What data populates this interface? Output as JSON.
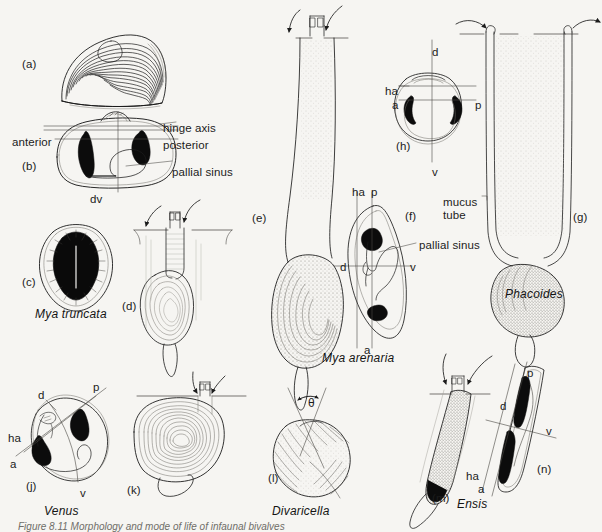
{
  "figure": {
    "background_color": "#f6f5f2",
    "ink_color": "#1c1c1c",
    "caption": "Figure 8.11   Morphology and mode of life of infaunal bivalves"
  },
  "panels": [
    {
      "id": "a",
      "label": "(a)",
      "x": 22,
      "y": 58
    },
    {
      "id": "b",
      "label": "(b)",
      "x": 22,
      "y": 160
    },
    {
      "id": "c",
      "label": "(c)",
      "x": 22,
      "y": 276
    },
    {
      "id": "d",
      "label": "(d)",
      "x": 122,
      "y": 300
    },
    {
      "id": "e",
      "label": "(e)",
      "x": 252,
      "y": 212
    },
    {
      "id": "f",
      "label": "(f)",
      "x": 405,
      "y": 210
    },
    {
      "id": "g",
      "label": "(g)",
      "x": 573,
      "y": 211
    },
    {
      "id": "h",
      "label": "(h)",
      "x": 396,
      "y": 140
    },
    {
      "id": "j",
      "label": "(j)",
      "x": 26,
      "y": 480
    },
    {
      "id": "k",
      "label": "(k)",
      "x": 127,
      "y": 484
    },
    {
      "id": "l",
      "label": "(l)",
      "x": 268,
      "y": 472
    },
    {
      "id": "m",
      "label": "(m)",
      "x": 432,
      "y": 492
    },
    {
      "id": "n",
      "label": "(n)",
      "x": 537,
      "y": 463
    }
  ],
  "species_labels": [
    {
      "name": "Mya truncata",
      "x": 35,
      "y": 308
    },
    {
      "name": "Mya arenaria",
      "x": 322,
      "y": 352
    },
    {
      "name": "Phacoides",
      "x": 505,
      "y": 288
    },
    {
      "name": "Venus",
      "x": 44,
      "y": 505
    },
    {
      "name": "Divaricella",
      "x": 272,
      "y": 505
    },
    {
      "name": "Ensis",
      "x": 457,
      "y": 498
    }
  ],
  "annotations": {
    "panel_b": [
      {
        "text": "hinge axis",
        "x": 163,
        "y": 122
      },
      {
        "text": "anterior",
        "x": 12,
        "y": 136
      },
      {
        "text": "posterior",
        "x": 163,
        "y": 139
      },
      {
        "text": "pallial sinus",
        "x": 172,
        "y": 166
      },
      {
        "text": "dv",
        "x": 90,
        "y": 193
      }
    ],
    "panel_f": [
      {
        "text": "ha",
        "x": 352,
        "y": 186
      },
      {
        "text": "p",
        "x": 371,
        "y": 186
      },
      {
        "text": "d",
        "x": 340,
        "y": 261
      },
      {
        "text": "v",
        "x": 410,
        "y": 261
      },
      {
        "text": "a",
        "x": 364,
        "y": 344
      },
      {
        "text": "pallial sinus",
        "x": 419,
        "y": 239
      }
    ],
    "panel_h": [
      {
        "text": "d",
        "x": 432,
        "y": 46
      },
      {
        "text": "ha",
        "x": 385,
        "y": 85
      },
      {
        "text": "a",
        "x": 392,
        "y": 99
      },
      {
        "text": "p",
        "x": 475,
        "y": 99
      },
      {
        "text": "v",
        "x": 432,
        "y": 166
      }
    ],
    "panel_g": [
      {
        "text": "mucus",
        "x": 443,
        "y": 196
      },
      {
        "text": "tube",
        "x": 443,
        "y": 209
      }
    ],
    "panel_j": [
      {
        "text": "d",
        "x": 38,
        "y": 389
      },
      {
        "text": "p",
        "x": 93,
        "y": 381
      },
      {
        "text": "ha",
        "x": 8,
        "y": 432
      },
      {
        "text": "a",
        "x": 10,
        "y": 458
      },
      {
        "text": "v",
        "x": 80,
        "y": 487
      }
    ],
    "panel_l": [
      {
        "text": "θ",
        "x": 308,
        "y": 397
      }
    ],
    "panel_mn": [
      {
        "text": "d",
        "x": 500,
        "y": 400
      },
      {
        "text": "p",
        "x": 527,
        "y": 367
      },
      {
        "text": "v",
        "x": 546,
        "y": 425
      },
      {
        "text": "ha",
        "x": 466,
        "y": 470
      },
      {
        "text": "a",
        "x": 478,
        "y": 483
      }
    ]
  },
  "icons": {
    "inhalant_siphon_arrow": "curved-arrow-in-icon",
    "exhalant_siphon_arrow": "curved-arrow-out-icon",
    "angle_marker": "double-headed-arc-arrow-icon"
  }
}
